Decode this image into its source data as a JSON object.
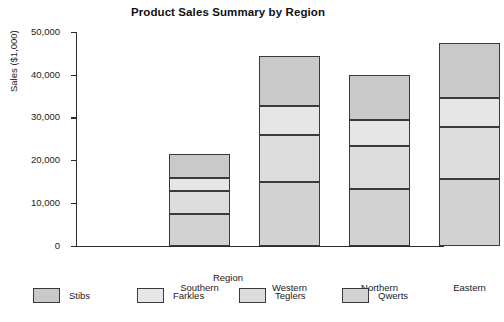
{
  "chart_data": {
    "type": "bar",
    "subtype": "stacked-bar",
    "title": "Product Sales Summary by Region",
    "xlabel": "Region",
    "ylabel": "Sales ($1,000)",
    "categories": [
      "Southern",
      "Western",
      "Northern",
      "Eastern"
    ],
    "ylim": [
      0,
      50000
    ],
    "yticks": [
      0,
      10000,
      20000,
      30000,
      40000,
      50000
    ],
    "ytick_labels": [
      "0",
      "10,000",
      "20,000",
      "30,000",
      "40,000",
      "50,000"
    ],
    "grid": false,
    "legend_position": "bottom",
    "stack_order_bottom_to_top": [
      "Qwerts",
      "Teglers",
      "Farkles",
      "Stibs"
    ],
    "series": [
      {
        "name": "Stibs",
        "color": "#c9c9c9",
        "values": [
          5500,
          11800,
          10600,
          13000
        ]
      },
      {
        "name": "Farkles",
        "color": "#e6e6e6",
        "values": [
          3200,
          6700,
          6100,
          6800
        ]
      },
      {
        "name": "Teglers",
        "color": "#dcdcdc",
        "values": [
          5400,
          11200,
          10100,
          12200
        ]
      },
      {
        "name": "Qwerts",
        "color": "#d2d2d2",
        "values": [
          7300,
          14800,
          13200,
          15500
        ]
      }
    ],
    "totals": [
      21400,
      44500,
      40000,
      47500
    ]
  },
  "legend": {
    "items": [
      {
        "label": "Stibs",
        "color": "#c9c9c9"
      },
      {
        "label": "Farkles",
        "color": "#e6e6e6"
      },
      {
        "label": "Teglers",
        "color": "#dcdcdc"
      },
      {
        "label": "Qwerts",
        "color": "#d2d2d2"
      }
    ]
  },
  "colors": {
    "axis": "#2b2b2b",
    "bar_edge": "#3a3a3a",
    "text": "#1a1a1a",
    "background": "#ffffff"
  }
}
